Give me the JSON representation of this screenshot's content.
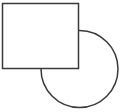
{
  "figure": {
    "canvas": {
      "width": 125,
      "height": 112,
      "background_color": "#ffffff"
    },
    "style": {
      "stroke_color": "#3a3a3a",
      "stroke_width": 1.5,
      "fill_color": "#ffffff"
    },
    "shapes": [
      {
        "name": "circle",
        "type": "circle",
        "label": "Circle",
        "center_x": 79.5,
        "center_y": 69,
        "radius": 38.5,
        "fill": "none",
        "stroke": "#3a3a3a",
        "stroke_width": 1.5,
        "z_order": 1,
        "bounds": {
          "left": 41,
          "top": 30.5,
          "right": 118,
          "bottom": 107.5
        }
      },
      {
        "name": "rectangle",
        "type": "rect",
        "label": "Rectangle",
        "x": 2.5,
        "y": 3.5,
        "width": 76,
        "height": 65,
        "fill": "#ffffff",
        "stroke": "#3a3a3a",
        "stroke_width": 1.5,
        "z_order": 2,
        "bounds": {
          "left": 2.5,
          "top": 3.5,
          "right": 78.5,
          "bottom": 68.5
        }
      }
    ],
    "intersections": [
      {
        "name": "top-intersection",
        "x": 78.5,
        "y": 30.5,
        "description": "circle meets rectangle right edge"
      },
      {
        "name": "left-intersection",
        "x": 43,
        "y": 68.5,
        "description": "circle meets rectangle bottom edge"
      }
    ]
  }
}
